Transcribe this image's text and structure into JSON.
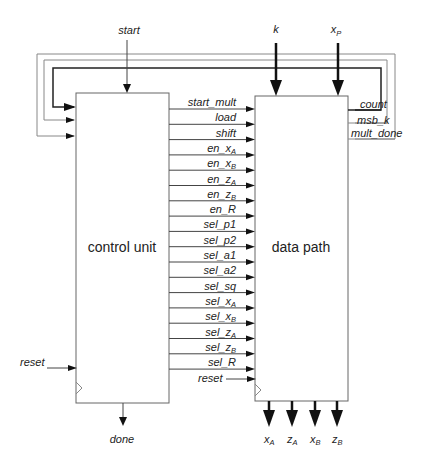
{
  "diagram": {
    "blocks": {
      "control_unit": "control unit",
      "data_path": "data path"
    },
    "inputs": {
      "start": "start",
      "k": "k",
      "xP": {
        "base": "x",
        "sub": "P"
      },
      "reset_cu": "reset",
      "reset_dp": "reset"
    },
    "outputs": {
      "done": "done",
      "data": [
        {
          "base": "x",
          "sub": "A"
        },
        {
          "base": "z",
          "sub": "A"
        },
        {
          "base": "x",
          "sub": "B"
        },
        {
          "base": "z",
          "sub": "B"
        }
      ]
    },
    "feedback": [
      "count",
      "msb_k",
      "mult_done"
    ],
    "control_signals": [
      {
        "base": "start_mult",
        "sub": ""
      },
      {
        "base": "load",
        "sub": ""
      },
      {
        "base": "shift",
        "sub": ""
      },
      {
        "base": "en_x",
        "sub": "A"
      },
      {
        "base": "en_x",
        "sub": "B"
      },
      {
        "base": "en_z",
        "sub": "A"
      },
      {
        "base": "en_z",
        "sub": "B"
      },
      {
        "base": "en_R",
        "sub": ""
      },
      {
        "base": "sel_p1",
        "sub": ""
      },
      {
        "base": "sel_p2",
        "sub": ""
      },
      {
        "base": "sel_a1",
        "sub": ""
      },
      {
        "base": "sel_a2",
        "sub": ""
      },
      {
        "base": "sel_sq",
        "sub": ""
      },
      {
        "base": "sel_x",
        "sub": "A"
      },
      {
        "base": "sel_x",
        "sub": "B"
      },
      {
        "base": "sel_z",
        "sub": "A"
      },
      {
        "base": "sel_z",
        "sub": "B"
      },
      {
        "base": "sel_R",
        "sub": ""
      }
    ]
  }
}
